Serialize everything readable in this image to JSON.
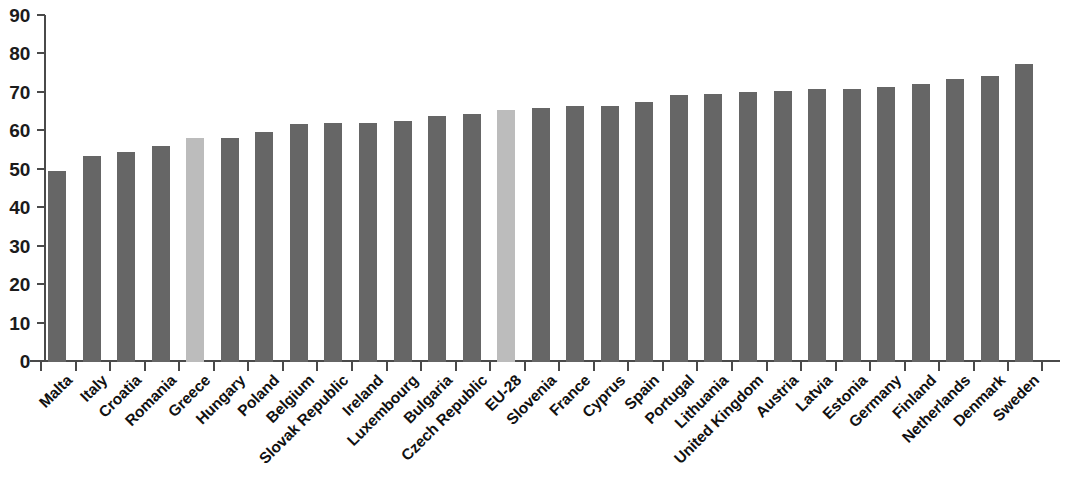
{
  "chart_data": {
    "type": "bar",
    "title": "",
    "subtitle": "",
    "xlabel": "",
    "ylabel": "",
    "ylim": [
      0,
      90
    ],
    "ytick_step": 10,
    "grid": false,
    "legend": "none",
    "yticks": [
      "90",
      "80",
      "70",
      "60",
      "50",
      "40",
      "30",
      "20",
      "10",
      "0"
    ],
    "categories": [
      "Malta",
      "Italy",
      "Croatia",
      "Romania",
      "Greece",
      "Hungary",
      "Poland",
      "Belgium",
      "Slovak Republic",
      "Ireland",
      "Luxembourg",
      "Bulgaria",
      "Czech Republic",
      "EU-28",
      "Slovenia",
      "France",
      "Cyprus",
      "Spain",
      "Portugal",
      "Lithuania",
      "United Kingdom",
      "Austria",
      "Latvia",
      "Estonia",
      "Germany",
      "Finland",
      "Netherlands",
      "Denmark",
      "Sweden"
    ],
    "values": [
      49.7,
      53.6,
      54.6,
      56.3,
      58.3,
      58.4,
      59.9,
      61.8,
      62.1,
      62.2,
      62.7,
      64.1,
      64.6,
      65.6,
      66.1,
      66.5,
      66.7,
      67.7,
      69.4,
      69.6,
      70.3,
      70.4,
      70.9,
      71.0,
      71.6,
      72.4,
      73.6,
      74.5,
      77.5
    ],
    "highlighted": [
      "Greece",
      "EU-28"
    ],
    "colors": {
      "bar": "#666666",
      "bar_highlight": "#bcbcbc",
      "axis": "#4a4a4a",
      "text": "#111111",
      "background": "#ffffff"
    }
  }
}
